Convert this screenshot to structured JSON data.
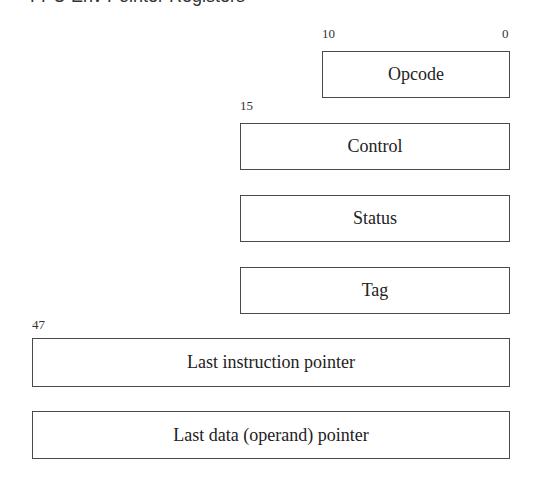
{
  "title_clipped": "FPU Env Pointer Registers",
  "registers": [
    {
      "name": "Opcode",
      "high_bit": "10",
      "low_bit": "0"
    },
    {
      "name": "Control",
      "high_bit": "15"
    },
    {
      "name": "Status"
    },
    {
      "name": "Tag"
    },
    {
      "name": "Last instruction pointer",
      "high_bit": "47"
    },
    {
      "name": "Last data (operand) pointer"
    }
  ],
  "colors": {
    "border": "#4a4a4a",
    "text": "#222222",
    "background": "#ffffff"
  }
}
